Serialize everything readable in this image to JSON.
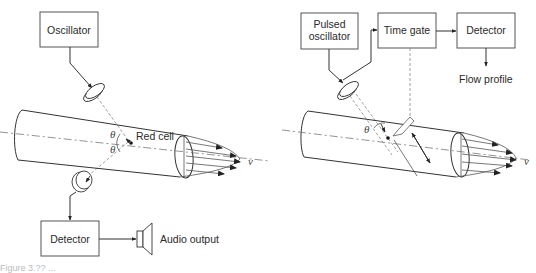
{
  "figure": {
    "caption": "Figure 3.?? ...",
    "colors": {
      "stroke": "#333333",
      "box_border": "#555555",
      "background": "#ffffff",
      "dashed": "#888888"
    }
  },
  "left_diagram": {
    "title": "Continuous-wave Doppler flowmeter",
    "oscillator_label": "Oscillator",
    "detector_label": "Detector",
    "audio_output_label": "Audio output",
    "red_cell_label": "Red cell",
    "theta_top": "θ",
    "theta_bottom": "θ",
    "velocity_label": "v",
    "icons": [
      "transmitter-transducer-icon",
      "receiver-transducer-icon",
      "speaker-icon"
    ]
  },
  "right_diagram": {
    "title": "Pulsed Doppler flowmeter",
    "pulsed_oscillator_label_line1": "Pulsed",
    "pulsed_oscillator_label_line2": "oscillator",
    "time_gate_label": "Time gate",
    "detector_label": "Detector",
    "flow_profile_label": "Flow profile",
    "theta": "θ",
    "velocity_label": "v",
    "icons": [
      "transducer-icon",
      "sample-volume-icon"
    ]
  }
}
